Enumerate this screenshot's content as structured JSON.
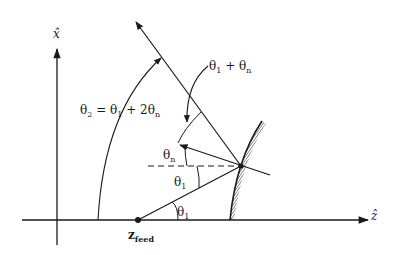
{
  "colors": {
    "ink": "#1a1a1a",
    "background": "#ffffff"
  },
  "axes": {
    "horizontal_label": "ẑ",
    "vertical_label": "x̂"
  },
  "feed": {
    "label_main": "z",
    "label_sub": "feed"
  },
  "angles": {
    "theta2_eq": {
      "main": "θ",
      "sub": "2",
      "rest": " = θ",
      "sub2": "1",
      "rest2": " + 2θ",
      "sub3": "n"
    },
    "theta1_plus_thetan": {
      "main": "θ",
      "sub": "1",
      "rest": " + θ",
      "sub2": "n"
    },
    "theta_n": {
      "main": "θ",
      "sub": "n"
    },
    "theta_1_upper": {
      "main": "θ",
      "sub": "1"
    },
    "theta_1_lower": {
      "main": "θ",
      "sub": "1"
    }
  }
}
